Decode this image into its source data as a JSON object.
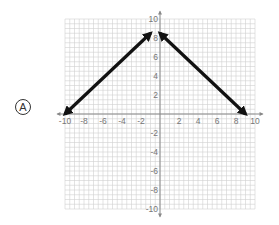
{
  "option": {
    "letter": "A"
  },
  "chart_data": {
    "type": "line",
    "title": "",
    "xlabel": "",
    "ylabel": "",
    "xlim": [
      -10,
      10
    ],
    "ylim": [
      -10,
      10
    ],
    "grid": true,
    "x_ticks": [
      "-10",
      "-8",
      "-6",
      "-4",
      "-2",
      "2",
      "4",
      "6",
      "8",
      "10"
    ],
    "y_ticks": [
      "10",
      "8",
      "6",
      "4",
      "2",
      "-2",
      "-4",
      "-6",
      "-8",
      "-10"
    ],
    "series": [
      {
        "name": "left ray",
        "points": [
          [
            -10,
            0
          ],
          [
            -1,
            8.5
          ]
        ],
        "arrows": "both"
      },
      {
        "name": "right ray",
        "points": [
          [
            0,
            8.5
          ],
          [
            9,
            0
          ]
        ],
        "arrows": "both"
      }
    ],
    "colors": {
      "line": "#111111",
      "grid": "#d0d0d0",
      "axis": "#888888"
    }
  }
}
